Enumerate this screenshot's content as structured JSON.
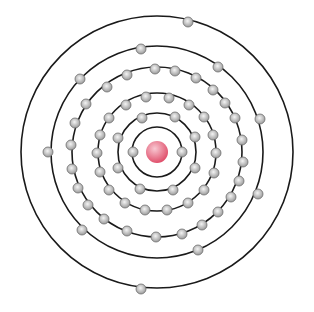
{
  "diagram": {
    "type": "bohr-atom-model",
    "width": 314,
    "height": 312,
    "center": [
      157,
      152
    ],
    "nucleus": {
      "radius": 11,
      "color": "#e0506c",
      "highlight": "#f8c8d2"
    },
    "orbit_color": "#1a1a1a",
    "electron": {
      "radius": 5,
      "color": "#9a9a9a",
      "highlight": "#f4f4f4",
      "stroke": "#6e6e6e"
    },
    "shells": [
      {
        "radius": 25,
        "electrons": [
          [
            133,
            152
          ],
          [
            182,
            152
          ]
        ]
      },
      {
        "radius": 39,
        "electrons": [
          [
            142,
            118
          ],
          [
            175,
            117
          ],
          [
            195,
            137
          ],
          [
            195,
            168
          ],
          [
            173,
            190
          ],
          [
            140,
            189
          ],
          [
            118,
            168
          ],
          [
            118,
            138
          ]
        ]
      },
      {
        "radius": 59,
        "electrons": [
          [
            146,
            97
          ],
          [
            169,
            98
          ],
          [
            189,
            105
          ],
          [
            204,
            117
          ],
          [
            213,
            135
          ],
          [
            216,
            153
          ],
          [
            214,
            173
          ],
          [
            204,
            190
          ],
          [
            188,
            203
          ],
          [
            167,
            210
          ],
          [
            145,
            210
          ],
          [
            125,
            203
          ],
          [
            109,
            190
          ],
          [
            100,
            172
          ],
          [
            97,
            153
          ],
          [
            100,
            135
          ],
          [
            109,
            118
          ],
          [
            126,
            105
          ]
        ]
      },
      {
        "radius": 85,
        "electrons": [
          [
            155,
            69
          ],
          [
            175,
            71
          ],
          [
            196,
            78
          ],
          [
            213,
            90
          ],
          [
            225,
            103
          ],
          [
            235,
            118
          ],
          [
            242,
            140
          ],
          [
            243,
            162
          ],
          [
            239,
            181
          ],
          [
            231,
            197
          ],
          [
            218,
            212
          ],
          [
            202,
            225
          ],
          [
            182,
            234
          ],
          [
            156,
            237
          ],
          [
            127,
            231
          ],
          [
            104,
            219
          ],
          [
            88,
            205
          ],
          [
            78,
            188
          ],
          [
            72,
            169
          ],
          [
            71,
            145
          ],
          [
            75,
            123
          ],
          [
            86,
            104
          ],
          [
            107,
            87
          ],
          [
            127,
            75
          ]
        ]
      },
      {
        "radius": 106,
        "electrons": [
          [
            141,
            49
          ],
          [
            218,
            67
          ],
          [
            260,
            119
          ],
          [
            258,
            194
          ],
          [
            198,
            250
          ],
          [
            82,
            230
          ],
          [
            48,
            152
          ],
          [
            80,
            79
          ]
        ]
      },
      {
        "radius": 136,
        "electrons": [
          [
            188,
            22
          ],
          [
            141,
            289
          ]
        ]
      }
    ]
  }
}
